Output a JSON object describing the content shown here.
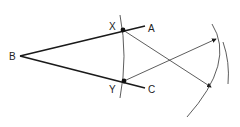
{
  "diagram": {
    "labels": {
      "B": "B",
      "X": "X",
      "A": "A",
      "Y": "Y",
      "C": "C"
    },
    "colors": {
      "line": "#1a1a1a",
      "text": "#222222"
    }
  }
}
